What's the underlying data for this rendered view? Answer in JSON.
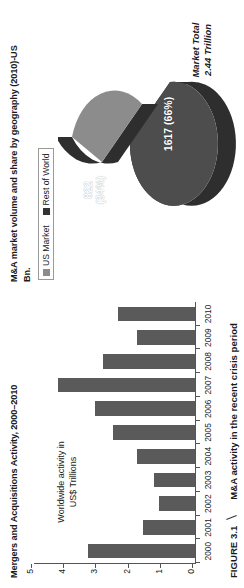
{
  "figure": {
    "caption_number": "FIGURE 3.1",
    "caption_text": "M&A activity in the recent crisis period"
  },
  "pie_panel": {
    "title": "M&A market volume and share by geography (2010)-US Bn.",
    "legend": [
      {
        "label": "US Market",
        "color": "#8c8c8c"
      },
      {
        "label": "Rest of World",
        "color": "#333333"
      }
    ],
    "market_total_line1": "Market Total",
    "market_total_line2": "2.44 Trillion",
    "slice_small_label": "822",
    "slice_small_pct": "(34%)",
    "slice_big_label": "1617 (66%)"
  },
  "bar_panel": {
    "title": "Mergers and Acquisitions Activity, 2000–2010",
    "axis_note_line1": "Worldwide activity in",
    "axis_note_line2": "US$ Trillions"
  },
  "chart_data": [
    {
      "type": "pie",
      "title": "M&A market volume and share by geography (2010)-US Bn.",
      "unit": "US$ Billions",
      "annotation": "Market Total 2.44 Trillion",
      "legend_position": "top-left",
      "slices": [
        {
          "name": "US Market",
          "value": 822,
          "percent": 34,
          "label": "822 (34%)",
          "color": "#8c8c8c",
          "exploded": true
        },
        {
          "name": "Rest of World",
          "value": 1617,
          "percent": 66,
          "label": "1617 (66%)",
          "color": "#4d4d4d",
          "exploded": false
        }
      ]
    },
    {
      "type": "bar",
      "title": "Mergers and Acquisitions Activity, 2000–2010",
      "xlabel": "",
      "ylabel": "Worldwide activity in US$ Trillions",
      "ylim": [
        0,
        5
      ],
      "yticks": [
        0,
        1,
        2,
        3,
        4,
        5
      ],
      "grid": false,
      "bar_color": "#5a5a5a",
      "categories": [
        "2000",
        "2001",
        "2002",
        "2003",
        "2004",
        "2005",
        "2006",
        "2007",
        "2008",
        "2009",
        "2010"
      ],
      "values": [
        3.33,
        1.63,
        1.13,
        1.27,
        1.8,
        2.55,
        3.1,
        4.25,
        2.85,
        1.8,
        2.4
      ]
    }
  ]
}
